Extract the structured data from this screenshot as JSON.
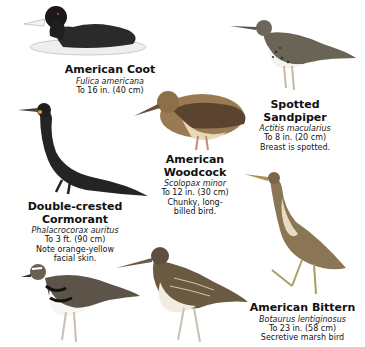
{
  "birds": [
    {
      "name": "American Coot",
      "scientific": "Fulica americana",
      "size": "To 16 in. (40 cm)",
      "note": ""
    },
    {
      "name_line1": "Spotted",
      "name_line2": "Sandpiper",
      "scientific": "Actitis macularius",
      "size": "To 8 in. (20 cm)",
      "note": "Breast is spotted."
    },
    {
      "name_line1": "American",
      "name_line2": "Woodcock",
      "scientific": "Scolopax minor",
      "size": "To 12 in. (30 cm)",
      "note_line1": "Chunky, long-",
      "note_line2": "billed bird."
    },
    {
      "name_line1": "Double-crested",
      "name_line2": "Cormorant",
      "scientific": "Phalacrocorax auritus",
      "size": "To 3 ft. (90 cm)",
      "note_line1": "Note orange-yellow",
      "note_line2": "facial skin."
    },
    {
      "name": "American Bittern",
      "scientific": "Botaurus lentiginosus",
      "size": "To 23 in. (58 cm)",
      "note": "Secretive marsh bird"
    }
  ],
  "illustrations": [
    "coot",
    "spotted-sandpiper",
    "woodcock",
    "cormorant",
    "bittern",
    "killdeer",
    "snipe"
  ]
}
